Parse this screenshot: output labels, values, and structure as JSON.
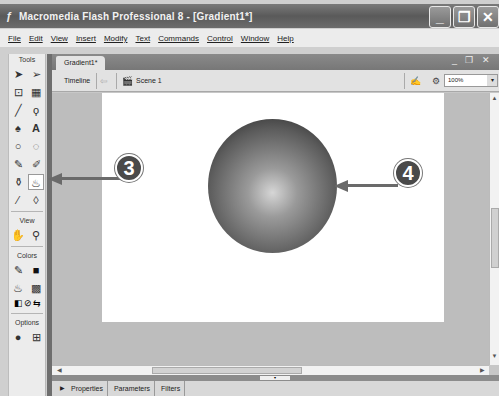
{
  "window": {
    "title": "Macromedia Flash Professional 8 - [Gradient1*]",
    "app_icon": "flash-icon",
    "controls": {
      "minimize": "_",
      "restore": "❐",
      "close": "✕"
    }
  },
  "menubar": {
    "items": [
      "File",
      "Edit",
      "View",
      "Insert",
      "Modify",
      "Text",
      "Commands",
      "Control",
      "Window",
      "Help"
    ]
  },
  "tools": {
    "title": "Tools",
    "tool_items": [
      {
        "name": "selection-tool",
        "glyph": "➤"
      },
      {
        "name": "subselection-tool",
        "glyph": "➢"
      },
      {
        "name": "free-transform-tool",
        "glyph": "⊡"
      },
      {
        "name": "gradient-transform-tool",
        "glyph": "▦"
      },
      {
        "name": "line-tool",
        "glyph": "╱"
      },
      {
        "name": "lasso-tool",
        "glyph": "ϙ"
      },
      {
        "name": "pen-tool",
        "glyph": "♠"
      },
      {
        "name": "text-tool",
        "glyph": "A"
      },
      {
        "name": "oval-tool",
        "glyph": "○"
      },
      {
        "name": "rectangle-tool",
        "glyph": "◌"
      },
      {
        "name": "pencil-tool",
        "glyph": "✎"
      },
      {
        "name": "brush-tool",
        "glyph": "✐"
      },
      {
        "name": "ink-bottle-tool",
        "glyph": "⚱"
      },
      {
        "name": "paint-bucket-tool",
        "glyph": "♨"
      },
      {
        "name": "eyedropper-tool",
        "glyph": "⁄"
      },
      {
        "name": "eraser-tool",
        "glyph": "◊"
      }
    ],
    "view_title": "View",
    "view_items": [
      {
        "name": "hand-tool",
        "glyph": "✋"
      },
      {
        "name": "zoom-tool",
        "glyph": "⚲"
      }
    ],
    "colors_title": "Colors",
    "color_items": [
      {
        "name": "stroke-color",
        "glyph": "✎",
        "swatch": "■"
      },
      {
        "name": "fill-color",
        "glyph": "♨",
        "swatch": "▩"
      }
    ],
    "color_extras": [
      "◧",
      "⊘",
      "⇆"
    ],
    "options_title": "Options",
    "option_items": [
      {
        "name": "gap-size-option",
        "glyph": "●"
      },
      {
        "name": "lock-fill-option",
        "glyph": "⊞"
      }
    ]
  },
  "document": {
    "tab": "Gradient1*",
    "controls": "_ ❐ ✕",
    "timeline_label": "Timeline",
    "back_glyph": "⇦",
    "scene_label": "Scene 1",
    "edit_icons": "✍ ⚙",
    "zoom_value": "100%",
    "zoom_arrow": "▾"
  },
  "scroll": {
    "up": "▲",
    "down": "▼",
    "left": "◀",
    "right": "▶"
  },
  "panels": {
    "expand": "▶",
    "tabs": [
      "Properties",
      "Parameters",
      "Filters"
    ]
  },
  "callouts": [
    {
      "number": "3",
      "target": "paint-bucket-tool"
    },
    {
      "number": "4",
      "target": "gradient-sphere"
    }
  ],
  "colors": {
    "titlebar": "#5a5a5a",
    "stage": "#ffffff",
    "callout": "#4a4a4a"
  }
}
